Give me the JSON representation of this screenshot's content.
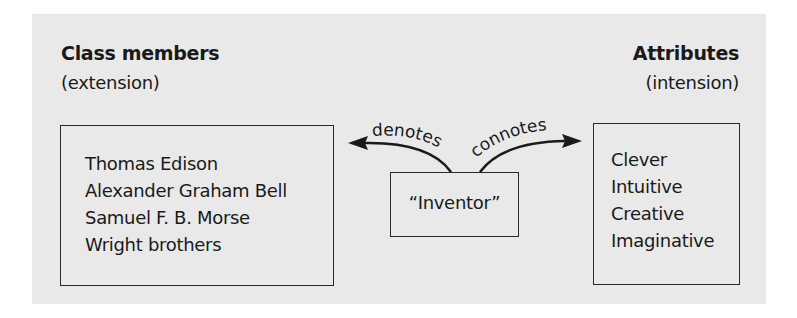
{
  "left": {
    "heading": "Class members",
    "subheading": "(extension)",
    "items": [
      "Thomas Edison",
      "Alexander Graham Bell",
      "Samuel F. B. Morse",
      "Wright brothers"
    ]
  },
  "center": {
    "term": "“Inventor”",
    "left_arrow_label": "denotes",
    "right_arrow_label": "connotes"
  },
  "right": {
    "heading": "Attributes",
    "subheading": "(intension)",
    "items": [
      "Clever",
      "Intuitive",
      "Creative",
      "Imaginative"
    ]
  },
  "colors": {
    "panel_background": "#e9e9e9",
    "stroke": "#1a1a1a"
  }
}
